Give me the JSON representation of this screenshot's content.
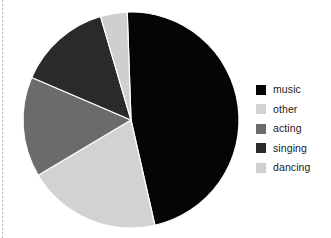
{
  "figure": {
    "background_color": "#ffffff",
    "width": 331,
    "height": 238
  },
  "chart_data": {
    "type": "pie",
    "title": "",
    "xlabel": "",
    "ylabel": "",
    "grid": false,
    "legend_position": "right",
    "start_angle_deg": -2,
    "direction": "clockwise",
    "center": {
      "x": 131,
      "y": 120
    },
    "radius": 108,
    "categories": [
      "music",
      "other",
      "acting",
      "singing",
      "dancing"
    ],
    "values": [
      47,
      20,
      15,
      14,
      4
    ],
    "percentages": [
      47,
      20,
      15,
      14,
      4
    ],
    "colors": [
      "#050505",
      "#d2d2d2",
      "#6b6b6b",
      "#2a2a2a",
      "#cfcfcf"
    ],
    "slices": [
      {
        "label": "music",
        "value": 47,
        "color": "#050505",
        "start_deg": -2,
        "end_deg": 167.2
      },
      {
        "label": "other",
        "value": 20,
        "color": "#d2d2d2",
        "start_deg": 167.2,
        "end_deg": 239.2
      },
      {
        "label": "acting",
        "value": 15,
        "color": "#6b6b6b",
        "start_deg": 239.2,
        "end_deg": 293.2
      },
      {
        "label": "singing",
        "value": 14,
        "color": "#2a2a2a",
        "start_deg": 293.2,
        "end_deg": 343.6
      },
      {
        "label": "dancing",
        "value": 4,
        "color": "#cfcfcf",
        "start_deg": 343.6,
        "end_deg": 358.0
      }
    ]
  },
  "legend": {
    "entries": [
      {
        "label": "music",
        "color": "#050505"
      },
      {
        "label": "other",
        "color": "#d2d2d2"
      },
      {
        "label": "acting",
        "color": "#6b6b6b"
      },
      {
        "label": "singing",
        "color": "#2a2a2a"
      },
      {
        "label": "dancing",
        "color": "#cfcfcf"
      }
    ]
  }
}
